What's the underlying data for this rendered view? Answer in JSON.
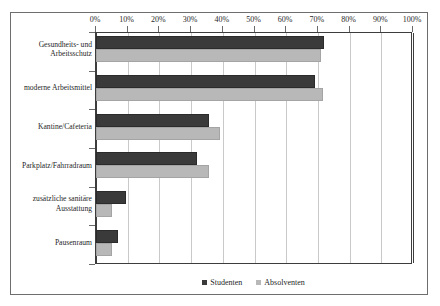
{
  "chart_data": {
    "type": "bar",
    "orientation": "horizontal",
    "title": "",
    "subtitle": "",
    "xlabel": "",
    "ylabel": "",
    "xlim": [
      0,
      100
    ],
    "xunit": "%",
    "grid": true,
    "legend_position": "bottom",
    "categories": [
      "Gesundheits- und Arbeitsschutz",
      "moderne Arbeitsmittel",
      "Kantine/Cafeteria",
      "Parkplatz/Fahrradraum",
      "zusätzliche sanitäre Ausstattung",
      "Pausenraum"
    ],
    "category_lines": [
      [
        "Gesundheits- und",
        "Arbeitsschutz"
      ],
      [
        "moderne Arbeitsmittel"
      ],
      [
        "Kantine/Cafeteria"
      ],
      [
        "Parkplatz/Fahrradraum"
      ],
      [
        "zusätzliche sanitäre",
        "Ausstattung"
      ],
      [
        "Pausenraum"
      ]
    ],
    "series": [
      {
        "name": "Studenten",
        "color": "#3a3a3a",
        "values": [
          72,
          69,
          35.5,
          32,
          9.5,
          7
        ]
      },
      {
        "name": "Absolventen",
        "color": "#b8b8b8",
        "values": [
          71,
          71.5,
          39,
          35.5,
          5,
          5
        ]
      }
    ],
    "x_ticks": [
      0,
      10,
      20,
      30,
      40,
      50,
      60,
      70,
      80,
      90,
      100
    ],
    "x_tick_labels": [
      "0%",
      "10%",
      "20%",
      "30%",
      "40%",
      "50%",
      "60%",
      "70%",
      "80%",
      "90%",
      "100%"
    ]
  },
  "legend": {
    "items": [
      {
        "label": "Studenten",
        "color": "#3a3a3a"
      },
      {
        "label": "Absolventen",
        "color": "#b8b8b8"
      }
    ]
  }
}
